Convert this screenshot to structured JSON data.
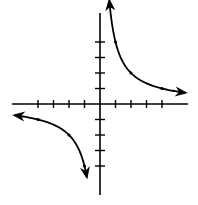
{
  "chart_data": {
    "type": "line",
    "title": "",
    "xlabel": "",
    "ylabel": "",
    "function": "y = 4/x",
    "xlim": [
      -5.5,
      5.5
    ],
    "ylim": [
      -5.8,
      5.9
    ],
    "grid": false,
    "legend": null,
    "x_ticks": [
      -4,
      -3,
      -2,
      -1,
      1,
      2,
      3,
      4
    ],
    "y_ticks": [
      -4,
      -3,
      -2,
      -1,
      1,
      2,
      3,
      4
    ],
    "tick_labels_shown": false,
    "series": [
      {
        "name": "branch-quadrant-1",
        "points": [
          [
            0.6,
            5.2
          ],
          [
            1,
            4
          ],
          [
            2,
            2
          ],
          [
            4,
            1
          ],
          [
            5.5,
            0.73
          ]
        ],
        "marked_points": [
          [
            1,
            4
          ],
          [
            2,
            2
          ],
          [
            4,
            1
          ]
        ],
        "arrows": [
          "start",
          "end"
        ]
      },
      {
        "name": "branch-quadrant-3",
        "points": [
          [
            -5.5,
            -0.73
          ],
          [
            -4,
            -1
          ],
          [
            -2,
            -2
          ],
          [
            -1,
            -4
          ],
          [
            -0.85,
            -5.3
          ]
        ],
        "marked_points": [
          [
            -4,
            -1
          ],
          [
            -2,
            -2
          ],
          [
            -1,
            -4
          ]
        ],
        "arrows": [
          "start",
          "end"
        ]
      }
    ],
    "colors": {
      "axis": "#000000",
      "curve": "#000000",
      "background": "#ffffff"
    }
  }
}
